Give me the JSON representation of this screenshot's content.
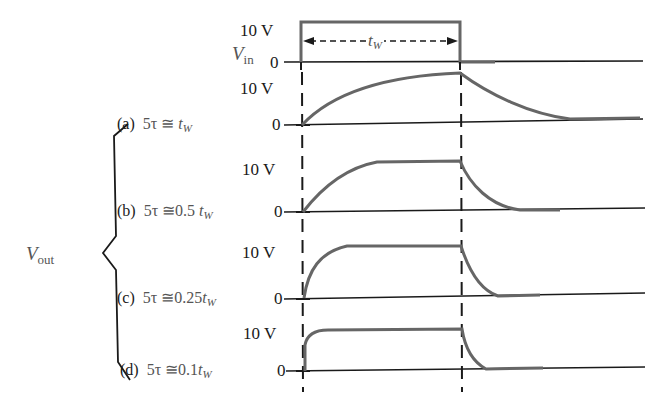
{
  "figure": {
    "input_signal": {
      "label_main": "V",
      "label_sub": "in",
      "high_label": "10 V",
      "low_label": "0",
      "pulse_width_label_main": "t",
      "pulse_width_label_sub": "W"
    },
    "output_signal": {
      "label_main": "V",
      "label_sub": "out"
    },
    "cases": [
      {
        "id": "a",
        "paren": "(a)",
        "expr_prefix": "5τ ≅",
        "expr_mult": "",
        "expr_var": "t",
        "expr_sub": "W",
        "high_label": "10 V",
        "low_label": "0"
      },
      {
        "id": "b",
        "paren": "(b)",
        "expr_prefix": "5τ ≅",
        "expr_mult": "0.5",
        "expr_var": "t",
        "expr_sub": "W",
        "high_label": "10 V",
        "low_label": "0"
      },
      {
        "id": "c",
        "paren": "(c)",
        "expr_prefix": "5τ ≅",
        "expr_mult": "0.25",
        "expr_var": "t",
        "expr_sub": "W",
        "high_label": "10 V",
        "low_label": "0"
      },
      {
        "id": "d",
        "paren": "(d)",
        "expr_prefix": "5τ ≅",
        "expr_mult": "0.1",
        "expr_var": "t",
        "expr_sub": "W",
        "high_label": "10 V",
        "low_label": "0"
      }
    ],
    "colors": {
      "ink": "#1a1a1a",
      "curve": "#666666",
      "label_gray": "#555555"
    }
  }
}
